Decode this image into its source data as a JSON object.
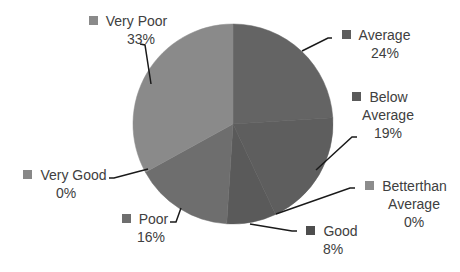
{
  "chart_data": {
    "type": "pie",
    "title": "",
    "categories": [
      "Average",
      "Below Average",
      "Betterthan Average",
      "Good",
      "Poor",
      "Very Good",
      "Very Poor"
    ],
    "values": [
      24,
      19,
      0,
      8,
      16,
      0,
      33
    ],
    "unit": "%",
    "start_angle_deg": 0,
    "direction": "clockwise",
    "colors": [
      "#646464",
      "#5e5e5e",
      "#8c8c8c",
      "#5a5a5a",
      "#6e6e6e",
      "#888888",
      "#8a8a8a"
    ],
    "data_labels": [
      {
        "name": "Average",
        "value": "24%"
      },
      {
        "name": "Below Average",
        "value": "19%"
      },
      {
        "name": "Betterthan Average",
        "value": "0%"
      },
      {
        "name": "Good",
        "value": "8%"
      },
      {
        "name": "Poor",
        "value": "16%"
      },
      {
        "name": "Very Good",
        "value": "0%"
      },
      {
        "name": "Very Poor",
        "value": "33%"
      }
    ],
    "legend": "inline-with-labels"
  },
  "labels": {
    "average": {
      "line1": "Average",
      "line2": "24%"
    },
    "below_average": {
      "line1": "Below",
      "line2": "Average",
      "line3": "19%"
    },
    "better_than_average": {
      "line1": "Betterthan",
      "line2": "Average",
      "line3": "0%"
    },
    "good": {
      "line1": "Good",
      "line2": "8%"
    },
    "poor": {
      "line1": "Poor",
      "line2": "16%"
    },
    "very_good": {
      "line1": "Very Good",
      "line2": "0%"
    },
    "very_poor": {
      "line1": "Very Poor",
      "line2": "33%"
    }
  }
}
